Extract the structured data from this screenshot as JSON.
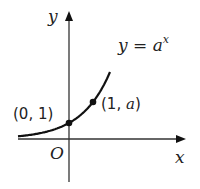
{
  "diagram": {
    "type": "function-graph",
    "function_label": {
      "lhs": "y",
      "eq": " = ",
      "base": "a",
      "exponent": "x"
    },
    "axes": {
      "x_label": "x",
      "y_label": "y",
      "origin_label": "O"
    },
    "points": [
      {
        "name": "y-intercept",
        "label": "(0, 1)",
        "x": 0,
        "y": 1
      },
      {
        "name": "point-one-a",
        "label_open": "(1, ",
        "label_var": "a",
        "label_close": ")",
        "x": 1,
        "y": "a"
      }
    ],
    "colors": {
      "stroke": "#1a1a1a",
      "axis": "#333333",
      "text": "#222222"
    }
  }
}
